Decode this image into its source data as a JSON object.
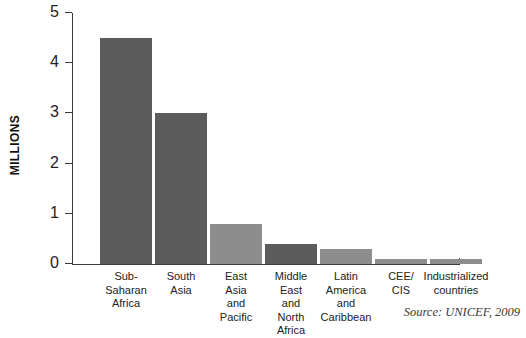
{
  "chart_data": {
    "type": "bar",
    "title": "",
    "xlabel": "",
    "ylabel": "MILLIONS",
    "ylim": [
      0,
      5
    ],
    "yticks": [
      0,
      1,
      2,
      3,
      4,
      5
    ],
    "ytick_labels": [
      "0",
      "1",
      "2",
      "3",
      "4",
      "5"
    ],
    "grid": false,
    "legend": "none",
    "categories": [
      "Sub-Saharan Africa",
      "South Asia",
      "East Asia and Pacific",
      "Middle East and North Africa",
      "Latin America and Caribbean",
      "CEE/ CIS",
      "Industrialized countries"
    ],
    "category_label_lines": [
      [
        "Sub-",
        "Saharan",
        "Africa"
      ],
      [
        "South",
        "Asia"
      ],
      [
        "East",
        "Asia",
        "and",
        "Pacific"
      ],
      [
        "Middle",
        "East",
        "and",
        "North",
        "Africa"
      ],
      [
        "Latin",
        "America",
        "and",
        "Caribbean"
      ],
      [
        "CEE/",
        "CIS"
      ],
      [
        "Industrialized",
        "countries"
      ]
    ],
    "values": [
      4.5,
      3.0,
      0.8,
      0.4,
      0.3,
      0.1,
      0.1
    ],
    "bar_colors": [
      "dark",
      "dark",
      "light",
      "dark",
      "light",
      "light",
      "light"
    ],
    "colors": {
      "dark": "#5c5c5c",
      "light": "#8d8d8d",
      "axis": "#3a3a3a",
      "text": "#222222",
      "background": "#ffffff"
    }
  },
  "axis": {
    "y_title": "MILLIONS"
  },
  "footer": {
    "source": "Source: UNICEF, 2009"
  }
}
